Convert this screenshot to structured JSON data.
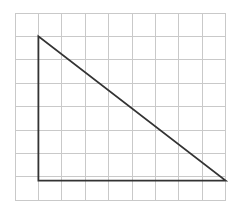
{
  "figure": {
    "background_color": "#ffffff",
    "canvas": {
      "width": 236,
      "height": 213
    }
  },
  "grid": {
    "name": "square-grid",
    "origin_x": 15,
    "origin_y": 13,
    "cell_size": 23.4,
    "columns": 9,
    "rows": 8,
    "right_x": 225.6,
    "bottom_y": 200.2,
    "line_color": "#c9c9c9",
    "line_width": 1
  },
  "shape": {
    "name": "right-triangle",
    "type": "polygon",
    "stroke_color": "#333333",
    "stroke_width": 1.8,
    "fill_color": "none",
    "vertices": [
      {
        "label": "apex",
        "x": 38.4,
        "y": 36.4
      },
      {
        "label": "right-angle-corner",
        "x": 38.4,
        "y": 180.6
      },
      {
        "label": "base-right",
        "x": 225.6,
        "y": 180.6
      }
    ],
    "points_attr": "38.4,36.4 38.4,180.6 225.6,180.6"
  },
  "chart_data": {
    "type": "scatter",
    "subtitle": "",
    "xlabel": "",
    "ylabel": "",
    "grid": true,
    "legend": "none",
    "xlim": [
      0,
      9
    ],
    "ylim": [
      0,
      8
    ],
    "x_ticks": [
      0,
      1,
      2,
      3,
      4,
      5,
      6,
      7,
      8,
      9
    ],
    "y_ticks": [
      0,
      1,
      2,
      3,
      4,
      5,
      6,
      7,
      8
    ],
    "x_tick_labels": [],
    "y_tick_labels": [],
    "series": [
      {
        "name": "right-triangle",
        "type": "polygon",
        "closed": true,
        "points_grid_units": [
          {
            "x": 1,
            "y": 7
          },
          {
            "x": 1,
            "y": 1
          },
          {
            "x": 9,
            "y": 1
          }
        ],
        "color": "#333333"
      }
    ],
    "annotations": [],
    "measurements": {
      "vertical_leg_cells": 6,
      "horizontal_leg_cells": 8,
      "hypotenuse_cells": 10,
      "right_angle_at": "bottom-left vertex"
    }
  }
}
